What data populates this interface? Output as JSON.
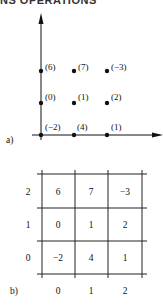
{
  "header": {
    "cut_text": "NS OPERATIONS"
  },
  "panel_a": {
    "label": "a)",
    "points": [
      {
        "x": 0,
        "y": 0,
        "value": "(−2)"
      },
      {
        "x": 1,
        "y": 0,
        "value": "(4)"
      },
      {
        "x": 2,
        "y": 0,
        "value": "(1)"
      },
      {
        "x": 0,
        "y": 1,
        "value": "(0)"
      },
      {
        "x": 1,
        "y": 1,
        "value": "(1)"
      },
      {
        "x": 2,
        "y": 1,
        "value": "(2)"
      },
      {
        "x": 0,
        "y": 2,
        "value": "(6)"
      },
      {
        "x": 1,
        "y": 2,
        "value": "(7)"
      },
      {
        "x": 2,
        "y": 2,
        "value": "(−3)"
      }
    ]
  },
  "panel_b": {
    "label": "b)",
    "row_labels": [
      "2",
      "1",
      "0"
    ],
    "col_labels": [
      "0",
      "1",
      "2"
    ],
    "cells": [
      [
        "6",
        "7",
        "−3"
      ],
      [
        "0",
        "1",
        "2"
      ],
      [
        "−2",
        "4",
        "1"
      ]
    ]
  }
}
